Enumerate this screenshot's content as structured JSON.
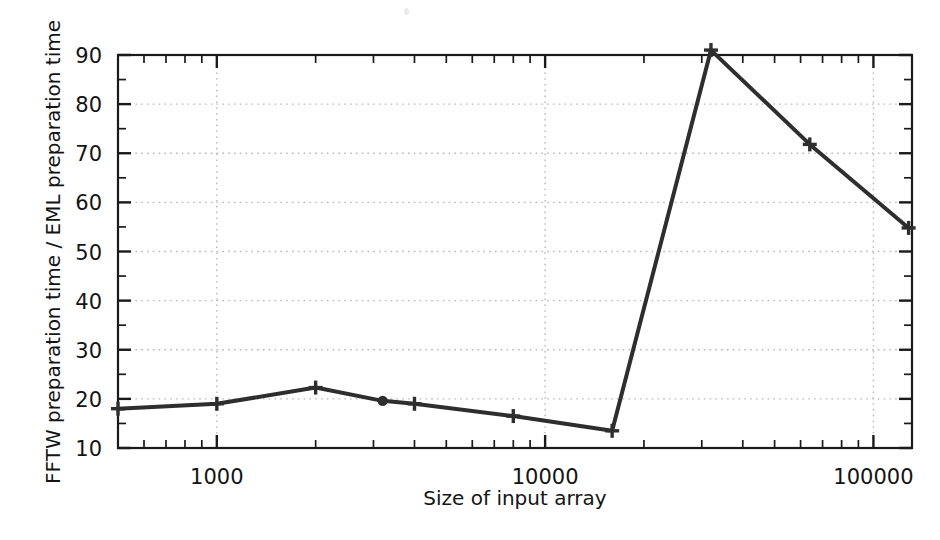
{
  "chart_data": {
    "type": "line",
    "title": "",
    "subtitle": "",
    "xlabel": "Size of input array",
    "ylabel": "FFTW preparation time / EML preparation time",
    "xscale": "log",
    "yscale": "linear",
    "xlim": [
      500,
      131072
    ],
    "ylim": [
      10,
      90
    ],
    "grid": true,
    "grid_axis": "y",
    "legend": null,
    "legend_position": "none",
    "x_tick_labels": [
      "1000",
      "10000",
      "100000"
    ],
    "x_tick_values": [
      1000,
      10000,
      100000
    ],
    "y_tick_labels": [
      "10",
      "20",
      "30",
      "40",
      "50",
      "60",
      "70",
      "80",
      "90"
    ],
    "y_tick_values": [
      10,
      20,
      30,
      40,
      50,
      60,
      70,
      80,
      90
    ],
    "minor_ticks": true,
    "series": [
      {
        "name": "FFTW / EML preparation time ratio",
        "color": "#2e2e2e",
        "marker": "plus",
        "x": [
          500,
          1000,
          2000,
          3200,
          4000,
          8000,
          16000,
          32000,
          64000,
          128000
        ],
        "y": [
          18.0,
          19.0,
          22.3,
          19.6,
          19.0,
          16.5,
          13.5,
          91.0,
          71.8,
          54.8
        ]
      }
    ],
    "annotations": []
  },
  "axes": {
    "x_axis_label": "Size of input array",
    "y_axis_label": "FFTW preparation time / EML preparation time"
  },
  "colors": {
    "line": "#2e2e2e",
    "axis": "#1a1a1a",
    "grid": "#b9b9b9",
    "background": "#ffffff",
    "text": "#141414"
  }
}
